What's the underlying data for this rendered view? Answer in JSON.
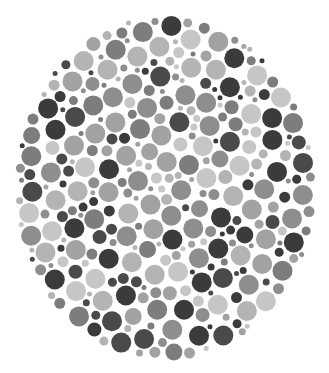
{
  "plate": {
    "kind": "color-vision-test-plate",
    "rendering": "grayscale",
    "center": [
      165,
      188
    ],
    "radius_x": 151,
    "radius_y": 173,
    "background": "#ffffff",
    "palette": [
      "#3b3b3b",
      "#4a4a4a",
      "#7d7d7d",
      "#8e8e8e",
      "#a2a2a2",
      "#b4b4b4",
      "#c6c6c6"
    ],
    "palette_weights": [
      0.14,
      0.12,
      0.14,
      0.16,
      0.16,
      0.16,
      0.12
    ],
    "dot_radius_min": 2.5,
    "dot_radius_max": 10,
    "seed": 7
  }
}
